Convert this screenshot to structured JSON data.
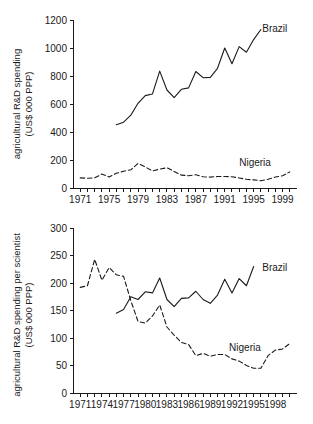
{
  "figure": {
    "background": "#ffffff",
    "ink_color": "#1a1a1a"
  },
  "chart_data": [
    {
      "id": "top",
      "type": "line",
      "title": "",
      "xlabel": "",
      "ylabel": "agricultural R&D spending (US$ 000 PPP)",
      "ylabel_line1": "agricultural R&D spending",
      "ylabel_line2": "(US$ 000 PPP)",
      "xlim": [
        1970,
        2001
      ],
      "ylim": [
        0,
        1200
      ],
      "yticks": [
        0,
        200,
        400,
        600,
        800,
        1000,
        1200
      ],
      "ytick_labels": [
        "0",
        "200",
        "400",
        "600",
        "800",
        "1000",
        "1200"
      ],
      "xticks": [
        1971,
        1972,
        1973,
        1974,
        1975,
        1976,
        1977,
        1978,
        1979,
        1980,
        1981,
        1982,
        1983,
        1984,
        1985,
        1986,
        1987,
        1988,
        1989,
        1990,
        1991,
        1992,
        1993,
        1994,
        1995,
        1996,
        1997,
        1998,
        1999,
        2000
      ],
      "xtick_labels": [
        {
          "value": 1971,
          "label": "1971"
        },
        {
          "value": 1975,
          "label": "1975"
        },
        {
          "value": 1979,
          "label": "1979"
        },
        {
          "value": 1983,
          "label": "1983"
        },
        {
          "value": 1987,
          "label": "1987"
        },
        {
          "value": 1991,
          "label": "1991"
        },
        {
          "value": 1995,
          "label": "1995"
        },
        {
          "value": 1999,
          "label": "1999"
        }
      ],
      "grid": false,
      "legend_position": "inline-end-of-line",
      "series": [
        {
          "name": "Brazil",
          "style": "solid",
          "label_x": 1996.2,
          "label_y": 1140,
          "x": [
            1976,
            1977,
            1978,
            1979,
            1980,
            1981,
            1982,
            1983,
            1984,
            1985,
            1986,
            1987,
            1988,
            1989,
            1990,
            1991,
            1992,
            1993,
            1994,
            1995,
            1996
          ],
          "values": [
            452,
            470,
            520,
            605,
            660,
            672,
            835,
            700,
            645,
            705,
            715,
            832,
            788,
            790,
            855,
            1000,
            888,
            1010,
            970,
            1060,
            1132
          ]
        },
        {
          "name": "Nigeria",
          "style": "dashed",
          "label_x": 1993.0,
          "label_y": 185,
          "x": [
            1971,
            1972,
            1973,
            1974,
            1975,
            1976,
            1977,
            1978,
            1979,
            1980,
            1981,
            1982,
            1983,
            1984,
            1985,
            1986,
            1987,
            1988,
            1989,
            1990,
            1991,
            1992,
            1993,
            1994,
            1995,
            1996,
            1997,
            1998,
            1999,
            2000
          ],
          "values": [
            72,
            70,
            72,
            100,
            78,
            105,
            120,
            130,
            175,
            150,
            122,
            135,
            145,
            118,
            92,
            88,
            95,
            80,
            78,
            82,
            82,
            80,
            72,
            62,
            58,
            52,
            62,
            78,
            88,
            115
          ]
        }
      ]
    },
    {
      "id": "bottom",
      "type": "line",
      "title": "",
      "xlabel": "",
      "ylabel": "agricultural R&D spending per scientist (US$ 000 PPP)",
      "ylabel_line1": "agricultural R&D spending per scientist",
      "ylabel_line2": "(US$ 000 PPP)",
      "xlim": [
        1970,
        2001
      ],
      "ylim": [
        0,
        300
      ],
      "yticks": [
        0,
        50,
        100,
        150,
        200,
        250,
        300
      ],
      "ytick_labels": [
        "0",
        "50",
        "100",
        "150",
        "200",
        "250",
        "300"
      ],
      "xticks": [
        1971,
        1972,
        1973,
        1974,
        1975,
        1976,
        1977,
        1978,
        1979,
        1980,
        1981,
        1982,
        1983,
        1984,
        1985,
        1986,
        1987,
        1988,
        1989,
        1990,
        1991,
        1992,
        1993,
        1994,
        1995,
        1996,
        1997,
        1998,
        1999,
        2000
      ],
      "xtick_labels": [
        {
          "value": 1971,
          "label": "1971"
        },
        {
          "value": 1974,
          "label": "1974"
        },
        {
          "value": 1977,
          "label": "1977"
        },
        {
          "value": 1980,
          "label": "1980"
        },
        {
          "value": 1983,
          "label": "1983"
        },
        {
          "value": 1986,
          "label": "1986"
        },
        {
          "value": 1989,
          "label": "1989"
        },
        {
          "value": 1992,
          "label": "1992"
        },
        {
          "value": 1995,
          "label": "1995"
        },
        {
          "value": 1998,
          "label": "1998"
        }
      ],
      "grid": false,
      "legend_position": "inline-end-of-line",
      "series": [
        {
          "name": "Brazil",
          "style": "solid",
          "label_x": 1996.2,
          "label_y": 228,
          "x": [
            1976,
            1977,
            1978,
            1979,
            1980,
            1981,
            1982,
            1983,
            1984,
            1985,
            1986,
            1987,
            1988,
            1989,
            1990,
            1991,
            1992,
            1993,
            1994,
            1995
          ],
          "values": [
            145,
            152,
            175,
            170,
            184,
            182,
            209,
            170,
            157,
            172,
            173,
            185,
            170,
            163,
            178,
            207,
            182,
            208,
            195,
            230
          ]
        },
        {
          "name": "Nigeria",
          "style": "dashed",
          "label_x": 1991.6,
          "label_y": 83,
          "x": [
            1971,
            1972,
            1973,
            1974,
            1975,
            1976,
            1977,
            1978,
            1979,
            1980,
            1981,
            1982,
            1983,
            1984,
            1985,
            1986,
            1987,
            1988,
            1989,
            1990,
            1991,
            1992,
            1993,
            1994,
            1995,
            1996,
            1997,
            1998,
            1999,
            2000
          ],
          "values": [
            192,
            195,
            243,
            205,
            228,
            215,
            212,
            168,
            130,
            127,
            140,
            160,
            120,
            105,
            92,
            88,
            68,
            72,
            67,
            70,
            70,
            62,
            58,
            50,
            45,
            45,
            68,
            78,
            80,
            90
          ]
        }
      ]
    }
  ]
}
